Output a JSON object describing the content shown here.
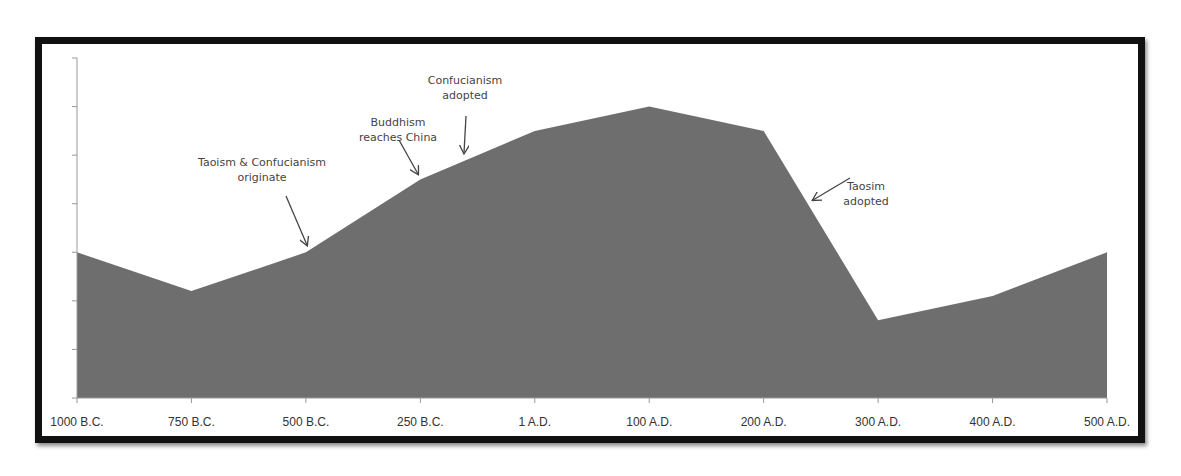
{
  "chart_data": {
    "type": "area",
    "title": "",
    "xlabel": "",
    "ylabel": "",
    "categories": [
      "1000 B.C.",
      "750 B.C.",
      "500 B.C.",
      "250 B.C.",
      "1 A.D.",
      "100 A.D.",
      "200 A.D.",
      "300 A.D.",
      "400 A.D.",
      "500 A.D."
    ],
    "values": [
      3.0,
      2.2,
      3.0,
      4.5,
      5.5,
      6.0,
      5.5,
      1.6,
      2.1,
      3.0
    ],
    "ylim": [
      0,
      7
    ],
    "y_ticks_labeled": false,
    "grid": false,
    "legend": null,
    "fill_color": "#6e6e6e",
    "annotations": [
      {
        "text": [
          "Taoism & Confucianism",
          "originate"
        ],
        "target": "500 B.C."
      },
      {
        "text": [
          "Buddhism",
          "reaches China"
        ],
        "target": "250 B.C."
      },
      {
        "text": [
          "Confucianism",
          "adopted"
        ],
        "target": "between 250 B.C. and 1 A.D."
      },
      {
        "text": [
          "Taosim",
          "adopted"
        ],
        "target": "between 200 A.D. and 300 A.D."
      }
    ]
  }
}
